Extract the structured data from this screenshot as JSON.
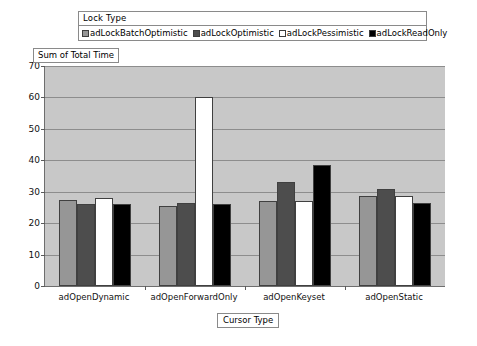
{
  "legend": {
    "title": "Lock Type",
    "entries": [
      {
        "label": "adLockBatchOptimistic",
        "color": "#969696"
      },
      {
        "label": "adLockOptimistic",
        "color": "#4d4d4d"
      },
      {
        "label": "adLockPessimistic",
        "color": "#ffffff"
      },
      {
        "label": "adLockReadOnly",
        "color": "#000000"
      }
    ]
  },
  "axes": {
    "y_title": "Sum of Total Time",
    "x_title": "Cursor Type",
    "y_ticks": [
      "70",
      "60",
      "50",
      "40",
      "30",
      "20",
      "10",
      "0"
    ]
  },
  "chart_data": {
    "type": "bar",
    "title": "",
    "xlabel": "Cursor Type",
    "ylabel": "Sum of Total Time",
    "ylim": [
      0,
      70
    ],
    "ytick_values": [
      0,
      10,
      20,
      30,
      40,
      50,
      60,
      70
    ],
    "grid": true,
    "legend_position": "top",
    "legend_title": "Lock Type",
    "categories": [
      "adOpenDynamic",
      "adOpenForwardOnly",
      "adOpenKeyset",
      "adOpenStatic"
    ],
    "series": [
      {
        "name": "adLockBatchOptimistic",
        "color": "#969696",
        "values": [
          27.5,
          25.5,
          27.0,
          28.5
        ]
      },
      {
        "name": "adLockOptimistic",
        "color": "#4d4d4d",
        "values": [
          26.0,
          26.5,
          33.0,
          31.0
        ]
      },
      {
        "name": "adLockPessimistic",
        "color": "#ffffff",
        "values": [
          28.0,
          60.0,
          27.0,
          28.5
        ]
      },
      {
        "name": "adLockReadOnly",
        "color": "#000000",
        "values": [
          26.0,
          26.0,
          38.5,
          26.5
        ]
      }
    ]
  },
  "style": {
    "plot_background": "#c8c8c8",
    "gridline_color": "#8d8d8d",
    "axis_color": "#6e6e6e",
    "page_background": "#ffffff"
  }
}
